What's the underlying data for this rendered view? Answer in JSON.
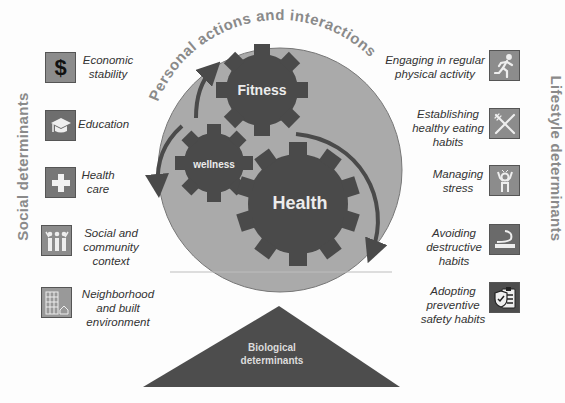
{
  "top_title": "Personal actions and interactions",
  "left_title": "Social determinants",
  "right_title": "Lifestyle determinants",
  "gears": {
    "fitness": "Fitness",
    "wellness": "wellness",
    "health": "Health"
  },
  "base": {
    "line1": "Biological",
    "line2": "determinants"
  },
  "social_items": [
    {
      "icon": "dollar-icon",
      "lines": [
        "Economic",
        "stability"
      ]
    },
    {
      "icon": "graduation-cap-icon",
      "lines": [
        "Education"
      ]
    },
    {
      "icon": "medical-cross-icon",
      "lines": [
        "Health",
        "care"
      ]
    },
    {
      "icon": "community-icon",
      "lines": [
        "Social and",
        "community",
        "context"
      ]
    },
    {
      "icon": "building-icon",
      "lines": [
        "Neighborhood",
        "and built",
        "environment"
      ]
    }
  ],
  "lifestyle_items": [
    {
      "icon": "runner-icon",
      "lines": [
        "Engaging in regular",
        "physical activity"
      ]
    },
    {
      "icon": "fork-knife-icon",
      "lines": [
        "Establishing",
        "healthy eating",
        "habits"
      ]
    },
    {
      "icon": "stress-icon",
      "lines": [
        "Managing",
        "stress"
      ]
    },
    {
      "icon": "cigarette-icon",
      "lines": [
        "Avoiding",
        "destructive",
        "habits"
      ]
    },
    {
      "icon": "safety-clipboard-icon",
      "lines": [
        "Adopting",
        "preventive",
        "safety habits"
      ]
    }
  ],
  "colors": {
    "circle": "#a9a9a9",
    "gear": "#4a4a4a",
    "triangle": "#4d4d4d",
    "icon_bg": "#8c8c8c",
    "title_gray": "#8a8a8a"
  }
}
